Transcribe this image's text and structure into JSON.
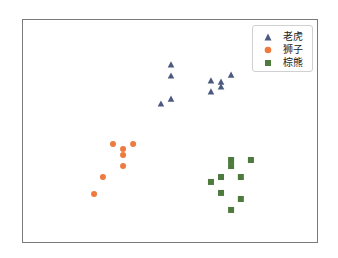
{
  "chart_data": {
    "type": "scatter",
    "title": "",
    "xlabel": "",
    "ylabel": "",
    "xlim": [
      0,
      100
    ],
    "ylim": [
      0,
      100
    ],
    "grid": false,
    "ticks_visible": false,
    "legend_position": "upper right",
    "series": [
      {
        "name": "老虎",
        "marker": "triangle",
        "color": "#4c5a80",
        "points": [
          [
            50.0,
            80.0
          ],
          [
            50.0,
            75.0
          ],
          [
            50.0,
            64.7
          ],
          [
            46.6,
            62.5
          ],
          [
            63.5,
            72.8
          ],
          [
            66.9,
            72.3
          ],
          [
            70.3,
            75.4
          ],
          [
            66.9,
            70.1
          ],
          [
            63.5,
            67.9
          ]
        ]
      },
      {
        "name": "狮子",
        "marker": "circle",
        "color": "#ee7a3f",
        "points": [
          [
            30.4,
            44.6
          ],
          [
            33.8,
            42.4
          ],
          [
            37.2,
            44.6
          ],
          [
            33.8,
            39.7
          ],
          [
            33.8,
            34.8
          ],
          [
            27.0,
            29.9
          ],
          [
            24.0,
            22.3
          ]
        ]
      },
      {
        "name": "棕熊",
        "marker": "square",
        "color": "#4e7a3e",
        "points": [
          [
            70.3,
            37.5
          ],
          [
            70.3,
            34.8
          ],
          [
            77.0,
            37.5
          ],
          [
            66.9,
            29.9
          ],
          [
            73.6,
            29.9
          ],
          [
            63.5,
            27.7
          ],
          [
            66.9,
            22.8
          ],
          [
            73.6,
            20.1
          ],
          [
            70.3,
            15.2
          ]
        ]
      }
    ]
  },
  "legend": {
    "items": [
      {
        "label": "老虎",
        "icon": "triangle-marker-icon",
        "color": "#4c5a80"
      },
      {
        "label": "狮子",
        "icon": "circle-marker-icon",
        "color": "#ee7a3f"
      },
      {
        "label": "棕熊",
        "icon": "square-marker-icon",
        "color": "#4e7a3e"
      }
    ]
  }
}
